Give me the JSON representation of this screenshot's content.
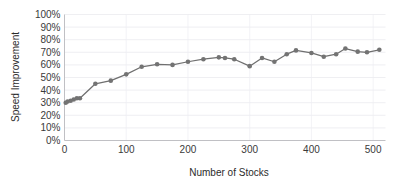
{
  "chart_data": {
    "type": "line",
    "title": "",
    "xlabel": "Number of Stocks",
    "ylabel": "Speed Improvement",
    "xlim": [
      0,
      520
    ],
    "ylim": [
      0,
      1.0
    ],
    "grid": true,
    "legend": false,
    "marker": "circle",
    "series_color": "#6f6f6f",
    "marker_color": "#737373",
    "gridline_color": "#e8e8ec",
    "axis_color": "#b9b9bd",
    "xticks": [
      0,
      100,
      200,
      300,
      400,
      500
    ],
    "xtick_labels": [
      "0",
      "100",
      "200",
      "300",
      "400",
      "500"
    ],
    "yticks": [
      0,
      0.1,
      0.2,
      0.3,
      0.4,
      0.5,
      0.6,
      0.7,
      0.8,
      0.9,
      1.0
    ],
    "ytick_labels": [
      "0%",
      "10%",
      "20%",
      "30%",
      "40%",
      "50%",
      "60%",
      "70%",
      "80%",
      "90%",
      "100%"
    ],
    "series": [
      {
        "name": "Speed Improvement",
        "x": [
          2,
          5,
          10,
          15,
          20,
          25,
          50,
          75,
          100,
          125,
          150,
          175,
          200,
          225,
          250,
          260,
          275,
          300,
          320,
          340,
          360,
          375,
          400,
          420,
          440,
          455,
          475,
          490,
          510
        ],
        "y": [
          0.3,
          0.31,
          0.315,
          0.325,
          0.335,
          0.335,
          0.45,
          0.475,
          0.525,
          0.585,
          0.605,
          0.6,
          0.625,
          0.645,
          0.66,
          0.655,
          0.645,
          0.59,
          0.655,
          0.625,
          0.685,
          0.715,
          0.695,
          0.665,
          0.685,
          0.73,
          0.705,
          0.7,
          0.72
        ]
      }
    ]
  }
}
